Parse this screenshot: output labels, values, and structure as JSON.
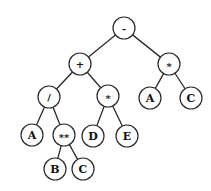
{
  "diagram": {
    "type": "expression-tree",
    "nodes": [
      {
        "id": "n1",
        "label": "-",
        "x": 124,
        "y": 28
      },
      {
        "id": "n2",
        "label": "+",
        "x": 80,
        "y": 64
      },
      {
        "id": "n3",
        "label": "*",
        "x": 169,
        "y": 64
      },
      {
        "id": "n4",
        "label": "/",
        "x": 49,
        "y": 97
      },
      {
        "id": "n5",
        "label": "*",
        "x": 108,
        "y": 96
      },
      {
        "id": "n6",
        "label": "A",
        "x": 150,
        "y": 98
      },
      {
        "id": "n7",
        "label": "C",
        "x": 191,
        "y": 98
      },
      {
        "id": "n8",
        "label": "A",
        "x": 32,
        "y": 135
      },
      {
        "id": "n9",
        "label": "**",
        "x": 64,
        "y": 135
      },
      {
        "id": "n10",
        "label": "D",
        "x": 93,
        "y": 136
      },
      {
        "id": "n11",
        "label": "E",
        "x": 127,
        "y": 136
      },
      {
        "id": "n12",
        "label": "B",
        "x": 55,
        "y": 169
      },
      {
        "id": "n13",
        "label": "C",
        "x": 83,
        "y": 169
      }
    ],
    "edges": [
      [
        "n1",
        "n2"
      ],
      [
        "n1",
        "n3"
      ],
      [
        "n2",
        "n4"
      ],
      [
        "n2",
        "n5"
      ],
      [
        "n3",
        "n6"
      ],
      [
        "n3",
        "n7"
      ],
      [
        "n4",
        "n8"
      ],
      [
        "n4",
        "n9"
      ],
      [
        "n5",
        "n10"
      ],
      [
        "n5",
        "n11"
      ],
      [
        "n9",
        "n12"
      ],
      [
        "n9",
        "n13"
      ]
    ],
    "node_radius": 11,
    "stroke_color": "#2a2a2a",
    "label_color": "#111111"
  }
}
